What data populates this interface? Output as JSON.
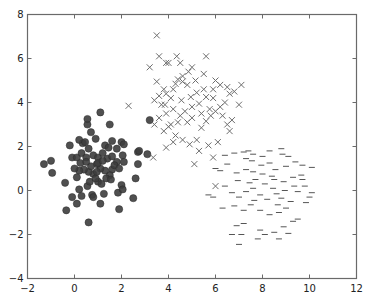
{
  "chart_data": {
    "type": "scatter",
    "title": "",
    "xlabel": "",
    "ylabel": "",
    "xlim": [
      -2,
      12
    ],
    "ylim": [
      -4,
      8
    ],
    "grid": false,
    "legend": null,
    "x_ticks": [
      "-2",
      "0",
      "2",
      "4",
      "6",
      "8",
      "10",
      "12"
    ],
    "y_ticks": [
      "-4",
      "-2",
      "0",
      "2",
      "4",
      "6",
      "8"
    ],
    "series": [
      {
        "name": "cluster-circles",
        "marker": "o",
        "color": "#3d3d3d",
        "points": [
          [
            -1.3,
            1.2
          ],
          [
            -1.0,
            1.35
          ],
          [
            -0.95,
            0.8
          ],
          [
            -0.4,
            0.35
          ],
          [
            -0.35,
            -0.9
          ],
          [
            -0.1,
            -0.3
          ],
          [
            0.1,
            -0.6
          ],
          [
            0.2,
            0.05
          ],
          [
            0.3,
            -0.25
          ],
          [
            0.6,
            -1.45
          ],
          [
            0.55,
            0.2
          ],
          [
            0.65,
            0.4
          ],
          [
            0.75,
            -0.2
          ],
          [
            0.8,
            -0.3
          ],
          [
            1.0,
            0.4
          ],
          [
            1.1,
            -0.6
          ],
          [
            1.25,
            -0.15
          ],
          [
            1.85,
            -0.1
          ],
          [
            1.9,
            -0.85
          ],
          [
            2.0,
            0.25
          ],
          [
            2.05,
            0.05
          ],
          [
            2.5,
            -0.35
          ],
          [
            2.6,
            0.55
          ],
          [
            2.7,
            1.2
          ],
          [
            2.1,
            1.3
          ],
          [
            2.05,
            1.6
          ],
          [
            1.8,
            1.3
          ],
          [
            1.6,
            0.95
          ],
          [
            1.5,
            0.7
          ],
          [
            1.3,
            0.9
          ],
          [
            1.1,
            1.0
          ],
          [
            0.95,
            1.2
          ],
          [
            0.8,
            0.75
          ],
          [
            0.6,
            0.85
          ],
          [
            0.4,
            0.95
          ],
          [
            0.2,
            0.9
          ],
          [
            0.0,
            1.0
          ],
          [
            -0.1,
            1.5
          ],
          [
            0.1,
            1.5
          ],
          [
            0.3,
            1.7
          ],
          [
            0.5,
            1.5
          ],
          [
            0.6,
            1.9
          ],
          [
            0.8,
            1.6
          ],
          [
            1.0,
            1.5
          ],
          [
            1.2,
            1.7
          ],
          [
            1.4,
            1.45
          ],
          [
            1.6,
            1.55
          ],
          [
            1.8,
            1.9
          ],
          [
            2.0,
            2.2
          ],
          [
            0.35,
            2.15
          ],
          [
            0.2,
            2.3
          ],
          [
            -0.2,
            2.05
          ],
          [
            0.45,
            2.2
          ],
          [
            0.9,
            2.35
          ],
          [
            1.3,
            2.05
          ],
          [
            1.6,
            2.25
          ],
          [
            2.1,
            2.1
          ],
          [
            0.7,
            2.65
          ],
          [
            0.55,
            3.0
          ],
          [
            0.55,
            3.25
          ],
          [
            1.1,
            3.55
          ],
          [
            1.5,
            3.0
          ],
          [
            1.0,
            1.25
          ],
          [
            1.2,
            1.35
          ],
          [
            0.7,
            1.1
          ],
          [
            0.9,
            0.55
          ],
          [
            1.35,
            0.55
          ],
          [
            1.55,
            0.5
          ],
          [
            1.15,
            0.3
          ],
          [
            0.95,
            0.85
          ],
          [
            2.7,
            1.75
          ],
          [
            3.1,
            1.65
          ],
          [
            2.75,
            1.8
          ],
          [
            3.2,
            3.2
          ],
          [
            0.25,
            1.25
          ],
          [
            0.5,
            1.3
          ],
          [
            1.7,
            1.15
          ],
          [
            1.9,
            1.0
          ],
          [
            0.1,
            0.6
          ],
          [
            1.45,
            1.95
          ]
        ]
      },
      {
        "name": "cluster-x",
        "marker": "x",
        "color": "#6e6e6e",
        "points": [
          [
            3.5,
            7.05
          ],
          [
            3.2,
            5.6
          ],
          [
            3.6,
            6.1
          ],
          [
            3.9,
            5.8
          ],
          [
            4.35,
            6.1
          ],
          [
            4.5,
            5.8
          ],
          [
            5.6,
            6.1
          ],
          [
            4.85,
            5.4
          ],
          [
            4.0,
            5.8
          ],
          [
            3.5,
            4.95
          ],
          [
            3.8,
            4.6
          ],
          [
            3.6,
            4.3
          ],
          [
            3.4,
            4.1
          ],
          [
            3.7,
            3.9
          ],
          [
            3.9,
            4.4
          ],
          [
            4.1,
            4.2
          ],
          [
            4.3,
            4.85
          ],
          [
            4.4,
            5.05
          ],
          [
            4.6,
            4.95
          ],
          [
            4.8,
            4.8
          ],
          [
            4.95,
            4.25
          ],
          [
            5.2,
            4.45
          ],
          [
            5.5,
            4.6
          ],
          [
            5.6,
            4.25
          ],
          [
            5.3,
            3.95
          ],
          [
            5.0,
            3.8
          ],
          [
            4.7,
            3.6
          ],
          [
            4.5,
            3.4
          ],
          [
            4.2,
            3.7
          ],
          [
            3.9,
            3.5
          ],
          [
            3.6,
            3.3
          ],
          [
            3.4,
            3.0
          ],
          [
            3.8,
            2.7
          ],
          [
            4.1,
            3.0
          ],
          [
            4.3,
            2.5
          ],
          [
            4.6,
            2.3
          ],
          [
            4.9,
            2.1
          ],
          [
            5.2,
            2.3
          ],
          [
            5.4,
            2.85
          ],
          [
            5.6,
            3.15
          ],
          [
            5.8,
            3.4
          ],
          [
            6.0,
            3.6
          ],
          [
            6.2,
            3.8
          ],
          [
            6.4,
            4.0
          ],
          [
            6.6,
            4.4
          ],
          [
            6.8,
            4.5
          ],
          [
            6.5,
            4.7
          ],
          [
            6.2,
            4.8
          ],
          [
            5.9,
            4.6
          ],
          [
            6.0,
            5.0
          ],
          [
            5.9,
            4.2
          ],
          [
            6.3,
            3.4
          ],
          [
            6.5,
            3.0
          ],
          [
            6.6,
            2.7
          ],
          [
            6.7,
            3.2
          ],
          [
            7.1,
            4.8
          ],
          [
            7.0,
            3.9
          ],
          [
            5.5,
            5.3
          ],
          [
            4.6,
            5.2
          ],
          [
            4.2,
            4.6
          ],
          [
            5.0,
            5.6
          ],
          [
            5.15,
            5.0
          ],
          [
            5.75,
            3.7
          ],
          [
            5.0,
            3.3
          ],
          [
            4.4,
            3.1
          ],
          [
            4.0,
            2.9
          ],
          [
            5.3,
            1.8
          ],
          [
            5.9,
            1.5
          ],
          [
            5.1,
            1.2
          ],
          [
            6.0,
            0.2
          ],
          [
            4.2,
            2.2
          ],
          [
            3.9,
            1.95
          ],
          [
            3.35,
            1.5
          ],
          [
            3.85,
            3.9
          ],
          [
            2.3,
            3.85
          ],
          [
            4.8,
            3.1
          ],
          [
            5.4,
            3.5
          ],
          [
            6.1,
            2.2
          ],
          [
            5.7,
            2.05
          ],
          [
            4.55,
            4.1
          ]
        ]
      },
      {
        "name": "cluster-dash",
        "marker": "_",
        "color": "#555555",
        "points": [
          [
            6.5,
            1.2
          ],
          [
            6.8,
            1.7
          ],
          [
            7.2,
            1.75
          ],
          [
            7.3,
            1.45
          ],
          [
            7.6,
            1.65
          ],
          [
            8.0,
            1.55
          ],
          [
            8.3,
            1.8
          ],
          [
            8.8,
            1.9
          ],
          [
            9.1,
            1.55
          ],
          [
            9.4,
            1.3
          ],
          [
            9.7,
            1.15
          ],
          [
            10.1,
            1.05
          ],
          [
            6.2,
            0.9
          ],
          [
            6.0,
            1.0
          ],
          [
            6.9,
            0.8
          ],
          [
            7.3,
            0.95
          ],
          [
            7.6,
            0.85
          ],
          [
            8.0,
            0.75
          ],
          [
            8.4,
            0.65
          ],
          [
            8.5,
            0.5
          ],
          [
            8.9,
            0.4
          ],
          [
            9.3,
            0.6
          ],
          [
            9.8,
            0.2
          ],
          [
            9.7,
            0.5
          ],
          [
            10.0,
            -0.3
          ],
          [
            6.4,
            0.2
          ],
          [
            6.7,
            -0.1
          ],
          [
            7.0,
            -0.3
          ],
          [
            7.3,
            -0.05
          ],
          [
            7.6,
            0.1
          ],
          [
            7.9,
            -0.2
          ],
          [
            8.2,
            -0.4
          ],
          [
            8.6,
            -0.15
          ],
          [
            8.8,
            -0.35
          ],
          [
            9.2,
            -0.5
          ],
          [
            9.5,
            -0.05
          ],
          [
            5.9,
            -0.3
          ],
          [
            6.3,
            -0.8
          ],
          [
            6.8,
            -0.7
          ],
          [
            7.2,
            -0.9
          ],
          [
            7.5,
            -0.65
          ],
          [
            7.9,
            -0.9
          ],
          [
            8.3,
            -1.1
          ],
          [
            8.7,
            -1.0
          ],
          [
            9.0,
            -0.8
          ],
          [
            9.5,
            -1.3
          ],
          [
            6.9,
            -1.6
          ],
          [
            7.2,
            -1.5
          ],
          [
            7.9,
            -1.8
          ],
          [
            8.5,
            -1.9
          ],
          [
            8.9,
            -1.65
          ],
          [
            9.1,
            -1.95
          ],
          [
            6.7,
            -2.0
          ],
          [
            7.8,
            -2.2
          ],
          [
            7.0,
            -2.45
          ],
          [
            7.1,
            -2.0
          ],
          [
            8.1,
            -2.0
          ],
          [
            8.7,
            -2.2
          ],
          [
            9.3,
            -1.4
          ],
          [
            10.1,
            -0.1
          ],
          [
            7.7,
            0.5
          ],
          [
            8.1,
            0.3
          ],
          [
            8.45,
            0.1
          ],
          [
            8.95,
            0.0
          ],
          [
            9.35,
            0.2
          ],
          [
            7.45,
            0.35
          ],
          [
            6.95,
            0.45
          ],
          [
            8.55,
            0.95
          ],
          [
            9.0,
            1.1
          ],
          [
            9.65,
            0.7
          ],
          [
            8.3,
            1.25
          ],
          [
            7.95,
            1.15
          ],
          [
            7.55,
            1.35
          ],
          [
            6.4,
            1.6
          ],
          [
            5.7,
            -0.2
          ],
          [
            7.65,
            -0.45
          ],
          [
            8.65,
            -0.65
          ],
          [
            9.85,
            -0.55
          ],
          [
            7.4,
            1.8
          ],
          [
            8.85,
            1.65
          ]
        ]
      }
    ]
  }
}
